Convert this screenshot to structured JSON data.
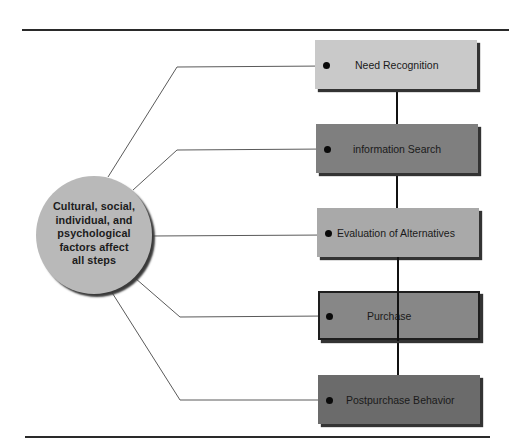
{
  "diagram": {
    "type": "consumer-buying-process",
    "influence": {
      "lines": [
        "Cultural, social,",
        "individual, and",
        "psychological",
        "factors affect",
        "all steps"
      ]
    },
    "steps": [
      {
        "label": "Need Recognition",
        "fill": "#c9c9c9"
      },
      {
        "label": "information Search",
        "fill": "#7f7f7f"
      },
      {
        "label": "Evaluation of Alternatives",
        "fill": "#a9a9a9"
      },
      {
        "label": "Purchase",
        "fill": "#878787"
      },
      {
        "label": "Postpurchase Behavior",
        "fill": "#6b6b6b"
      }
    ],
    "colors": {
      "circle_fill": "#b9b9b9",
      "line": "#555555",
      "spine": "#111111",
      "rule": "#2a2a2a"
    }
  }
}
